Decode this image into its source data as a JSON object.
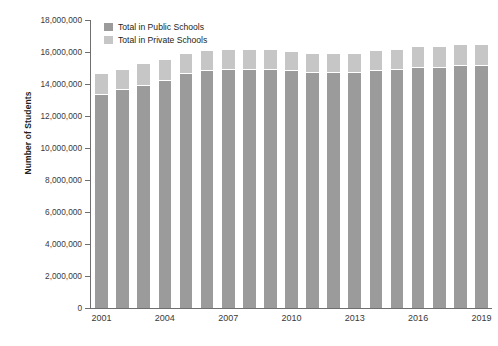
{
  "chart_data": {
    "type": "bar",
    "subtype": "stacked-bar",
    "title": "",
    "xlabel": "",
    "ylabel": "Number of Students",
    "ylim": [
      0,
      18000000
    ],
    "ytick_values": [
      0,
      2000000,
      4000000,
      6000000,
      8000000,
      10000000,
      12000000,
      14000000,
      16000000,
      18000000
    ],
    "ytick_labels": [
      "0",
      "2,000,000",
      "4,000,000",
      "6,000,000",
      "8,000,000",
      "10,000,000",
      "12,000,000",
      "14,000,000",
      "16,000,000",
      "18,000,000"
    ],
    "categories": [
      "2001",
      "2002",
      "2003",
      "2004",
      "2005",
      "2006",
      "2007",
      "2008",
      "2009",
      "2010",
      "2011",
      "2012",
      "2013",
      "2014",
      "2015",
      "2016",
      "2017",
      "2018",
      "2019"
    ],
    "xtick_labels_shown": [
      "2001",
      "2004",
      "2007",
      "2010",
      "2013",
      "2016",
      "2019"
    ],
    "grid": false,
    "legend_position": "top-left",
    "series": [
      {
        "name": "Total in Public Schools",
        "color": "#9b9b9b",
        "values": [
          13300000,
          13600000,
          13900000,
          14200000,
          14600000,
          14800000,
          14900000,
          14900000,
          14900000,
          14800000,
          14700000,
          14700000,
          14700000,
          14800000,
          14900000,
          15000000,
          15000000,
          15100000,
          15100000
        ]
      },
      {
        "name": "Total in Private Schools",
        "color": "#c6c6c6",
        "values": [
          1300000,
          1300000,
          1350000,
          1300000,
          1250000,
          1250000,
          1250000,
          1200000,
          1200000,
          1200000,
          1150000,
          1150000,
          1200000,
          1250000,
          1250000,
          1300000,
          1300000,
          1350000,
          1350000
        ]
      }
    ],
    "totals": [
      14600000,
      14900000,
      15250000,
      15500000,
      15850000,
      16050000,
      16150000,
      16100000,
      16100000,
      16000000,
      15850000,
      15850000,
      15900000,
      16050000,
      16150000,
      16300000,
      16300000,
      16450000,
      16450000
    ]
  }
}
